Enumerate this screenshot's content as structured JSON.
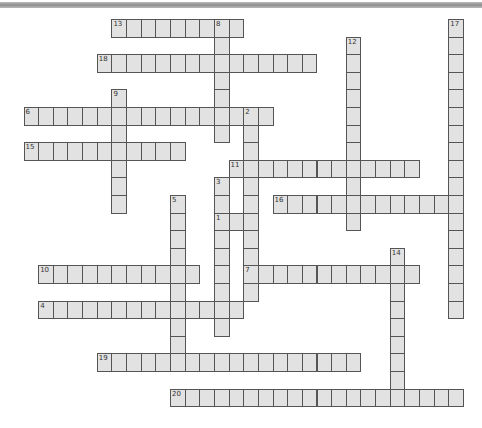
{
  "puzzle": {
    "layout": {
      "origin_x": 23.5,
      "origin_y": 19,
      "cell_w": 14.65,
      "cell_h": 17.6
    },
    "colors": {
      "cell_fill": "#e2e2e2",
      "cell_border": "#555555",
      "background": "#ffffff"
    },
    "words": [
      {
        "number": "13",
        "direction": "across",
        "row": 0,
        "col": 6,
        "length": 9
      },
      {
        "number": "8",
        "direction": "down",
        "row": 0,
        "col": 13,
        "length": 7
      },
      {
        "number": "17",
        "direction": "down",
        "row": 0,
        "col": 29,
        "length": 17
      },
      {
        "number": "12",
        "direction": "down",
        "row": 1,
        "col": 22,
        "length": 11
      },
      {
        "number": "18",
        "direction": "across",
        "row": 2,
        "col": 5,
        "length": 15
      },
      {
        "number": "9",
        "direction": "down",
        "row": 4,
        "col": 6,
        "length": 7
      },
      {
        "number": "6",
        "direction": "across",
        "row": 5,
        "col": 0,
        "length": 17
      },
      {
        "number": "2",
        "direction": "down",
        "row": 5,
        "col": 15,
        "length": 11
      },
      {
        "number": "15",
        "direction": "across",
        "row": 7,
        "col": 0,
        "length": 11
      },
      {
        "number": "11",
        "direction": "across",
        "row": 8,
        "col": 14,
        "length": 13
      },
      {
        "number": "3",
        "direction": "down",
        "row": 9,
        "col": 13,
        "length": 9
      },
      {
        "number": "5",
        "direction": "down",
        "row": 10,
        "col": 10,
        "length": 10
      },
      {
        "number": "16",
        "direction": "across",
        "row": 10,
        "col": 17,
        "length": 13
      },
      {
        "number": "1",
        "direction": "across",
        "row": 11,
        "col": 13,
        "length": 3
      },
      {
        "number": "14",
        "direction": "down",
        "row": 13,
        "col": 25,
        "length": 9
      },
      {
        "number": "10",
        "direction": "across",
        "row": 14,
        "col": 1,
        "length": 11
      },
      {
        "number": "7",
        "direction": "across",
        "row": 14,
        "col": 15,
        "length": 12
      },
      {
        "number": "4",
        "direction": "across",
        "row": 16,
        "col": 1,
        "length": 14
      },
      {
        "number": "19",
        "direction": "across",
        "row": 19,
        "col": 5,
        "length": 18
      },
      {
        "number": "20",
        "direction": "across",
        "row": 21,
        "col": 10,
        "length": 20
      }
    ]
  }
}
